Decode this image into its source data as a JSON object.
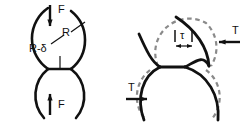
{
  "figure": {
    "background_color": "#ffffff",
    "solid_stroke_color": "#111111",
    "dashed_stroke_color": "#8a8a8a",
    "text_color": "#111111",
    "panels": [
      {
        "id": "left-panel",
        "name": "normal-load-panel",
        "description": "Two spheres pressed together by equal and opposite normal forces F, showing contact flattening",
        "labels": [
          {
            "id": "force-top",
            "text": "F",
            "x": 60,
            "y": 14,
            "arrow": "down"
          },
          {
            "id": "force-bottom",
            "text": "F",
            "x": 60,
            "y": 106,
            "arrow": "up"
          },
          {
            "id": "radius",
            "text": "R",
            "x": 72,
            "y": 35,
            "arrow": "leader"
          },
          {
            "id": "approach",
            "text": "R-δ",
            "x": 45,
            "y": 52,
            "arrow": "leader"
          }
        ]
      },
      {
        "id": "right-panel",
        "name": "tangential-load-panel",
        "description": "Same spheres sheared by equal and opposite tangential forces T; dashed outlines show undeformed position, solid outlines show displaced position, tau is the tangential offset",
        "labels": [
          {
            "id": "traction-top",
            "text": "T",
            "x": 224,
            "y": 34,
            "arrow": "left"
          },
          {
            "id": "traction-bottom",
            "text": "T",
            "x": 131,
            "y": 90,
            "arrow": "right"
          },
          {
            "id": "shear-offset",
            "text": "τ",
            "x": 184,
            "y": 36,
            "arrow": "dimension"
          }
        ]
      }
    ],
    "legend": {
      "solid": "deformed / displaced outline",
      "dashed": "original undeformed outline"
    }
  }
}
